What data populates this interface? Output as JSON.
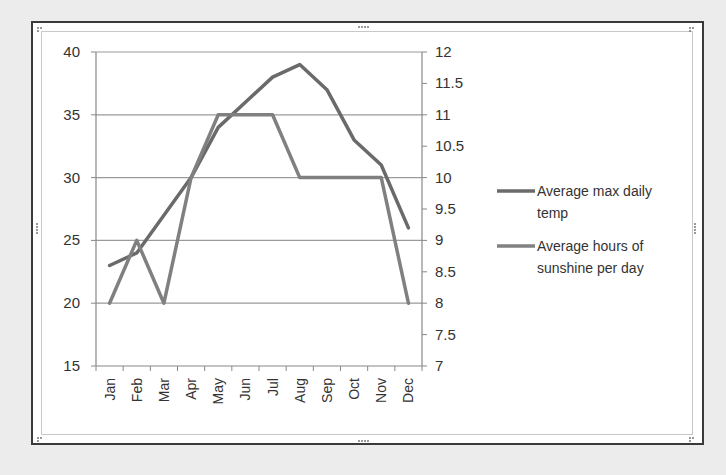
{
  "chart_data": {
    "type": "line",
    "title": "",
    "categories": [
      "Jan",
      "Feb",
      "Mar",
      "Apr",
      "May",
      "Jun",
      "Jul",
      "Aug",
      "Sep",
      "Oct",
      "Nov",
      "Dec"
    ],
    "series": [
      {
        "name": "Average max daily temp",
        "axis": "left",
        "color": "#6a6a6a",
        "values": [
          23,
          24,
          27,
          30,
          34,
          36,
          38,
          39,
          37,
          33,
          31,
          26
        ]
      },
      {
        "name": "Average hours of sunshine per day",
        "axis": "right",
        "color": "#808080",
        "values": [
          8,
          9,
          8,
          10,
          11,
          11,
          11,
          10,
          10,
          10,
          10,
          8
        ]
      }
    ],
    "left_axis": {
      "min": 15,
      "max": 40,
      "step": 5,
      "ticks": [
        "15",
        "20",
        "25",
        "30",
        "35",
        "40"
      ]
    },
    "right_axis": {
      "min": 7,
      "max": 12,
      "step": 0.5,
      "ticks": [
        "7",
        "7.5",
        "8",
        "8.5",
        "9",
        "9.5",
        "10",
        "10.5",
        "11",
        "11.5",
        "12"
      ]
    },
    "xlabel": "",
    "ylabel": "",
    "y2label": "",
    "grid": true,
    "legend": {
      "position": "right",
      "entries": [
        {
          "lines": [
            "Average max daily",
            "temp"
          ]
        },
        {
          "lines": [
            "Average hours of",
            "sunshine per day"
          ]
        }
      ]
    }
  }
}
